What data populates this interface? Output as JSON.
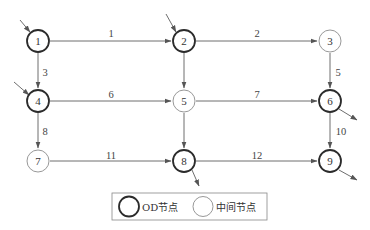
{
  "nodes": [
    {
      "id": "1",
      "type": "od",
      "x": 38,
      "y": 41
    },
    {
      "id": "2",
      "type": "od",
      "x": 184,
      "y": 41
    },
    {
      "id": "3",
      "type": "mid",
      "x": 330,
      "y": 41
    },
    {
      "id": "4",
      "type": "od",
      "x": 38,
      "y": 101
    },
    {
      "id": "5",
      "type": "mid",
      "x": 184,
      "y": 101
    },
    {
      "id": "6",
      "type": "od",
      "x": 330,
      "y": 101
    },
    {
      "id": "7",
      "type": "mid",
      "x": 38,
      "y": 161
    },
    {
      "id": "8",
      "type": "od",
      "x": 184,
      "y": 161
    },
    {
      "id": "9",
      "type": "od",
      "x": 330,
      "y": 161
    }
  ],
  "edges": [
    {
      "id": "1",
      "from": "1",
      "to": "2"
    },
    {
      "id": "2",
      "from": "2",
      "to": "3"
    },
    {
      "id": "3",
      "from": "1",
      "to": "4"
    },
    {
      "id": "4",
      "from": "2",
      "to": "5"
    },
    {
      "id": "5",
      "from": "3",
      "to": "6"
    },
    {
      "id": "6",
      "from": "4",
      "to": "5"
    },
    {
      "id": "7",
      "from": "5",
      "to": "6"
    },
    {
      "id": "8",
      "from": "4",
      "to": "7"
    },
    {
      "id": "9",
      "from": "5",
      "to": "8"
    },
    {
      "id": "10",
      "from": "6",
      "to": "9"
    },
    {
      "id": "11",
      "from": "7",
      "to": "8"
    },
    {
      "id": "12",
      "from": "8",
      "to": "9"
    }
  ],
  "edge_labels": {
    "e1": "1",
    "e2": "2",
    "e3": "3",
    "e5": "5",
    "e6": "6",
    "e7": "7",
    "e8": "8",
    "e10": "10",
    "e11": "11",
    "e12": "12"
  },
  "node_labels": {
    "n1": "1",
    "n2": "2",
    "n3": "3",
    "n4": "4",
    "n5": "5",
    "n6": "6",
    "n7": "7",
    "n8": "8",
    "n9": "9"
  },
  "inflows": [
    "1",
    "2",
    "4"
  ],
  "outflows": [
    "6",
    "8",
    "9"
  ],
  "legend": {
    "od_label": "OD节点",
    "mid_label": "中间节点"
  },
  "colors": {
    "od_stroke": "#2b2b2b",
    "mid_stroke": "#8c8c8c",
    "edge": "#6e6e6e"
  }
}
